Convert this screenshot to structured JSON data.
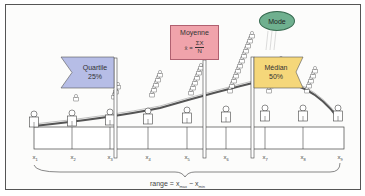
{
  "diagram": {
    "flags": {
      "quartile": {
        "title": "Quartile",
        "value": "25%",
        "color": "#b6bde6"
      },
      "median": {
        "title": "Médian",
        "value": "50%",
        "color": "#f5d77a"
      }
    },
    "mean": {
      "title": "Moyenne",
      "formula_lhs": "x̄ =",
      "formula_num": "ΣX",
      "formula_den": "N",
      "color": "#f0a3ab"
    },
    "mode": {
      "label": "Mode",
      "color": "#6fb08f"
    },
    "x_labels": [
      {
        "base": "x",
        "sub": "1"
      },
      {
        "base": "x",
        "sub": "2"
      },
      {
        "base": "x",
        "sub": "3"
      },
      {
        "base": "x",
        "sub": "4"
      },
      {
        "base": "x",
        "sub": "5"
      },
      {
        "base": "x",
        "sub": "6"
      },
      {
        "base": "x",
        "sub": "7"
      },
      {
        "base": "x",
        "sub": "8"
      },
      {
        "base": "x",
        "sub": "9"
      }
    ],
    "range": {
      "prefix": "range = x",
      "sub_max": "max",
      "minus": " − x",
      "sub_min": "min"
    }
  }
}
